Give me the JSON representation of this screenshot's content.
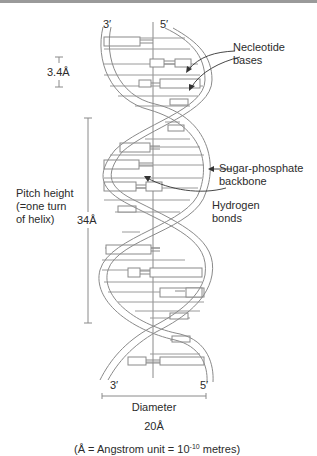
{
  "figure": {
    "strand_ends": {
      "top_left": "3′",
      "top_right": "5′",
      "bottom_left": "3′",
      "bottom_right": "5′"
    },
    "labels": {
      "nucleotide_bases_line1": "Necleotide",
      "nucleotide_bases_line2": "bases",
      "backbone_line1": "Sugar-phosphate",
      "backbone_line2": "backbone",
      "hydrogen_line1": "Hydrogen",
      "hydrogen_line2": "bonds",
      "pitch_line1": "Pitch height",
      "pitch_line2": "(=one turn",
      "pitch_line3": "of helix)"
    },
    "measurements": {
      "base_spacing": "3.4Å",
      "pitch": "34Å",
      "diameter_label": "Diameter",
      "diameter_value": "20Å"
    },
    "footnote": {
      "prefix": "(Å = Angstrom unit = 10",
      "exponent": "-10",
      "suffix": " metres)"
    },
    "colors": {
      "line": "#8a8a8a",
      "text": "#2b2b2b",
      "top_bar": "#9a9a9a"
    }
  }
}
